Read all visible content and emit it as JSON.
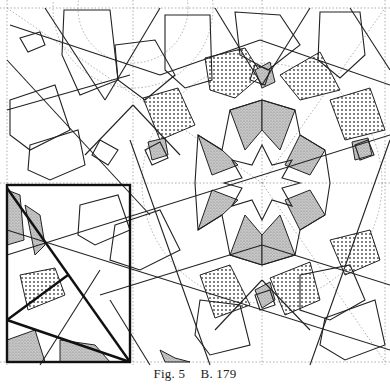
{
  "figure": {
    "type": "islamic-geometric-pattern",
    "colors": {
      "line": "#222222",
      "construction": "#9a9a9a",
      "stipple": "#8a8a8a",
      "dot_hatch": "#555555",
      "background": "#ffffff"
    },
    "center_star_points": 8
  },
  "caption": {
    "fig_label": "Fig. 5",
    "ref_label": "B. 179"
  }
}
